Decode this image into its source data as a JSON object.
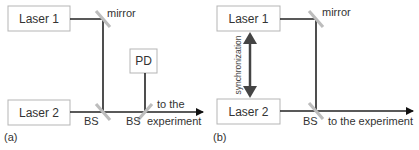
{
  "panel_a": {
    "label": "(a)",
    "laser1": "Laser 1",
    "laser2": "Laser 2",
    "photodiode": "PD",
    "mirror": "mirror",
    "beamsplitter1": "BS",
    "beamsplitter2": "BS",
    "output_line1": "to the",
    "output_line2": "experiment"
  },
  "panel_b": {
    "label": "(b)",
    "laser1": "Laser 1",
    "laser2": "Laser 2",
    "mirror": "mirror",
    "beamsplitter": "BS",
    "output": "to the experiment",
    "sync": "synchronization"
  },
  "colors": {
    "beam": "#222222",
    "optic": "#bdbdbd",
    "box_border": "#b5b5b5",
    "sync_arrow": "#444444"
  }
}
